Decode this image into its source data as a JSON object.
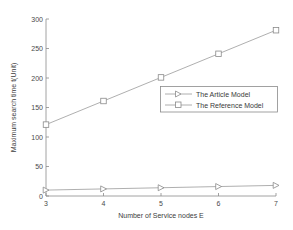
{
  "chart_data": {
    "type": "line",
    "title": "",
    "subtitle": "",
    "xlabel": "Number of Service nodes  E",
    "ylabel": "Maximum search time t(Unit)",
    "x": [
      3,
      4,
      5,
      6,
      7
    ],
    "xlim": [
      3,
      7
    ],
    "ylim": [
      0,
      300
    ],
    "xticks": [
      "3",
      "4",
      "5",
      "6",
      "7"
    ],
    "yticks": [
      "0",
      "50",
      "100",
      "150",
      "200",
      "250",
      "300"
    ],
    "grid": false,
    "legend_position": "center-right",
    "series": [
      {
        "name": "The Article Model",
        "marker": "triangle-right",
        "values": [
          10,
          12,
          14,
          16,
          18
        ]
      },
      {
        "name": "The Reference Model",
        "marker": "square",
        "values": [
          121,
          161,
          201,
          241,
          281
        ]
      }
    ],
    "colors": {
      "axis": "#8a8a8a",
      "line": "#9a9a9a",
      "text": "#3d3d3d",
      "background": "#ffffff"
    }
  },
  "legend": {
    "entries": [
      {
        "label": "The Article Model"
      },
      {
        "label": "The Reference Model"
      }
    ]
  },
  "axes": {
    "x_title": "Number of Service nodes  E",
    "y_title": "Maximum search time t(Unit)",
    "x_tick_labels": [
      "3",
      "4",
      "5",
      "6",
      "7"
    ],
    "y_tick_labels": [
      "300",
      "250",
      "200",
      "150",
      "100",
      "50",
      "0"
    ]
  }
}
